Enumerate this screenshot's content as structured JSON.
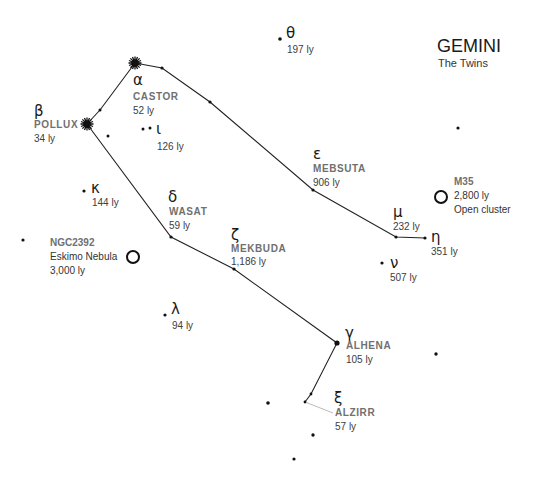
{
  "title": "GEMINI",
  "subtitle": "The Twins",
  "stars": [
    {
      "id": "castor",
      "greek": "α",
      "name": "CASTOR",
      "dist": "52 ly",
      "x": 135,
      "y": 63,
      "kind": "bright"
    },
    {
      "id": "pollux",
      "greek": "β",
      "name": "POLLUX",
      "dist": "34 ly",
      "x": 87,
      "y": 124,
      "kind": "bright"
    },
    {
      "id": "theta",
      "greek": "θ",
      "name": "",
      "dist": "197 ly",
      "x": 280,
      "y": 39,
      "kind": "dot"
    },
    {
      "id": "iota",
      "greek": "ι",
      "name": "",
      "dist": "126 ly",
      "x": 150,
      "y": 128,
      "kind": "dot"
    },
    {
      "id": "kappa",
      "greek": "κ",
      "name": "",
      "dist": "144 ly",
      "x": 84,
      "y": 191,
      "kind": "dot"
    },
    {
      "id": "delta",
      "greek": "δ",
      "name": "WASAT",
      "dist": "59 ly",
      "x": 171,
      "y": 237,
      "kind": "dot"
    },
    {
      "id": "epsilon",
      "greek": "ε",
      "name": "MEBSUTA",
      "dist": "906 ly",
      "x": 313,
      "y": 190,
      "kind": "dot"
    },
    {
      "id": "zeta",
      "greek": "ζ",
      "name": "MEKBUDA",
      "dist": "1,186 ly",
      "x": 234,
      "y": 269,
      "kind": "dot"
    },
    {
      "id": "mu",
      "greek": "μ",
      "name": "",
      "dist": "232 ly",
      "x": 396,
      "y": 237,
      "kind": "dot"
    },
    {
      "id": "eta",
      "greek": "η",
      "name": "",
      "dist": "351 ly",
      "x": 425,
      "y": 238,
      "kind": "dot"
    },
    {
      "id": "nu",
      "greek": "ν",
      "name": "",
      "dist": "507 ly",
      "x": 382,
      "y": 263,
      "kind": "dot"
    },
    {
      "id": "lambda",
      "greek": "λ",
      "name": "",
      "dist": "94 ly",
      "x": 165,
      "y": 315,
      "kind": "dot"
    },
    {
      "id": "gamma",
      "greek": "γ",
      "name": "ALHENA",
      "dist": "105 ly",
      "x": 337,
      "y": 343,
      "kind": "medium"
    },
    {
      "id": "xi",
      "greek": "ξ",
      "name": "ALZIRR",
      "dist": "57 ly",
      "x": 305,
      "y": 402,
      "kind": "dot"
    }
  ],
  "deep_sky": [
    {
      "id": "m35",
      "name": "M35",
      "lines": [
        "2,800 ly",
        "Open cluster"
      ],
      "x": 441,
      "y": 197
    },
    {
      "id": "ngc2392",
      "name": "NGC2392",
      "lines": [
        "Eskimo Nebula",
        "3,000 ly"
      ],
      "x": 133,
      "y": 257
    }
  ],
  "extra_dots": [
    {
      "x": 162,
      "y": 68
    },
    {
      "x": 210,
      "y": 102
    },
    {
      "x": 100,
      "y": 110
    },
    {
      "x": 108,
      "y": 136
    },
    {
      "x": 143,
      "y": 129
    },
    {
      "x": 458,
      "y": 128
    },
    {
      "x": 23,
      "y": 240
    },
    {
      "x": 436,
      "y": 354
    },
    {
      "x": 268,
      "y": 403
    },
    {
      "x": 311,
      "y": 394
    },
    {
      "x": 313,
      "y": 435
    },
    {
      "x": 294,
      "y": 459
    }
  ],
  "lines": [
    [
      [
        135,
        63
      ],
      [
        162,
        68
      ],
      [
        210,
        102
      ],
      [
        313,
        190
      ],
      [
        396,
        237
      ],
      [
        425,
        238
      ]
    ],
    [
      [
        135,
        63
      ],
      [
        100,
        110
      ],
      [
        87,
        124
      ]
    ],
    [
      [
        87,
        124
      ],
      [
        171,
        237
      ],
      [
        234,
        269
      ],
      [
        337,
        343
      ],
      [
        311,
        394
      ],
      [
        305,
        402
      ]
    ]
  ],
  "colors": {
    "background": "#ffffff",
    "line": "#222222",
    "label_name": "#707070",
    "label_text": "#404040"
  }
}
